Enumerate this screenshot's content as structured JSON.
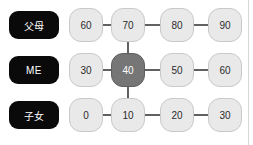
{
  "diagram": {
    "type": "family-generation-grid",
    "background_color": "#ffffff",
    "node_color": "#e9e9e9",
    "node_border_color": "#c9c9c9",
    "selected_node_color": "#767676",
    "selected_node_text_color": "#ffffff",
    "label_pill_color": "#0a0a0a",
    "label_pill_text_color": "#ffffff",
    "connector_color": "#3a3a3a",
    "divider_color": "#d8d8d8",
    "rows": [
      {
        "label": "父母",
        "label_name": "row-label-parents",
        "nodes": [
          {
            "value": "60",
            "selected": false
          },
          {
            "value": "70",
            "selected": false
          },
          {
            "value": "80",
            "selected": false
          },
          {
            "value": "90",
            "selected": false
          }
        ]
      },
      {
        "label": "ME",
        "label_name": "row-label-me",
        "nodes": [
          {
            "value": "30",
            "selected": false
          },
          {
            "value": "40",
            "selected": true
          },
          {
            "value": "50",
            "selected": false
          },
          {
            "value": "60",
            "selected": false
          }
        ]
      },
      {
        "label": "子女",
        "label_name": "row-label-children",
        "nodes": [
          {
            "value": "0",
            "selected": false
          },
          {
            "value": "10",
            "selected": false
          },
          {
            "value": "20",
            "selected": false
          },
          {
            "value": "30",
            "selected": false
          }
        ]
      }
    ],
    "column_x_centers": [
      86,
      128,
      177,
      225
    ],
    "row_y_centers": [
      25,
      70,
      115
    ],
    "horizontal_edges": [
      {
        "row": 0,
        "from_col": 0,
        "to_col": 1
      },
      {
        "row": 0,
        "from_col": 1,
        "to_col": 2
      },
      {
        "row": 0,
        "from_col": 2,
        "to_col": 3
      },
      {
        "row": 1,
        "from_col": 0,
        "to_col": 1
      },
      {
        "row": 1,
        "from_col": 1,
        "to_col": 2
      },
      {
        "row": 1,
        "from_col": 2,
        "to_col": 3
      },
      {
        "row": 2,
        "from_col": 0,
        "to_col": 1
      },
      {
        "row": 2,
        "from_col": 1,
        "to_col": 2
      },
      {
        "row": 2,
        "from_col": 2,
        "to_col": 3
      }
    ],
    "vertical_edges": [
      {
        "col": 1,
        "from_row": 0,
        "to_row": 1
      },
      {
        "col": 1,
        "from_row": 1,
        "to_row": 2
      }
    ]
  }
}
